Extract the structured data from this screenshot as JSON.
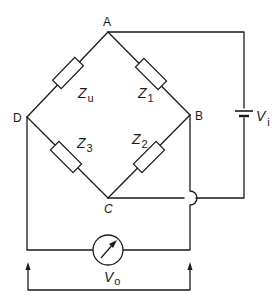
{
  "diagram": {
    "nodes": {
      "A": "A",
      "B": "B",
      "C": "C",
      "D": "D"
    },
    "impedances": [
      {
        "id": "zu",
        "main": "Z",
        "sub": "u",
        "between": [
          "A",
          "D"
        ]
      },
      {
        "id": "z1",
        "main": "Z",
        "sub": "1",
        "between": [
          "A",
          "B"
        ]
      },
      {
        "id": "z3",
        "main": "Z",
        "sub": "3",
        "between": [
          "D",
          "C"
        ]
      },
      {
        "id": "z2",
        "main": "Z",
        "sub": "2",
        "between": [
          "B",
          "C"
        ]
      }
    ],
    "source": {
      "main": "V",
      "sub": "i",
      "connected": [
        "A",
        "C"
      ],
      "icon": "battery-icon"
    },
    "output": {
      "main": "V",
      "sub": "o",
      "connected": [
        "D",
        "B"
      ],
      "icon": "meter-icon"
    },
    "colors": {
      "line": "#1a1a1a",
      "background": "#ffffff"
    }
  }
}
